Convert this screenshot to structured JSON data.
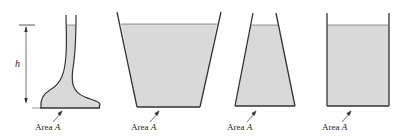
{
  "figure": {
    "fill_color": "#d9d9d9",
    "wall_color": "#333333",
    "height_label": "h",
    "containers": [
      {
        "id": "irregular",
        "shape": "curved neck with flared base",
        "label_prefix": "Area",
        "label_var": "A"
      },
      {
        "id": "wide-top",
        "shape": "trapezoid widening upward",
        "label_prefix": "Area",
        "label_var": "A"
      },
      {
        "id": "narrow-top",
        "shape": "trapezoid narrowing upward",
        "label_prefix": "Area",
        "label_var": "A"
      },
      {
        "id": "rectangular",
        "shape": "straight-walled rectangle",
        "label_prefix": "Area",
        "label_var": "A"
      }
    ]
  }
}
